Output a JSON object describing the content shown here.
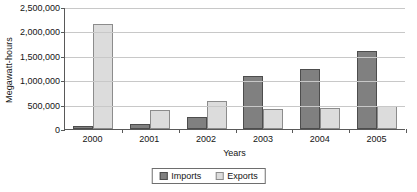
{
  "chart_data": {
    "type": "bar",
    "title": "",
    "xlabel": "Years",
    "ylabel": "Megawatt-hours",
    "categories": [
      "2000",
      "2001",
      "2002",
      "2003",
      "2004",
      "2005"
    ],
    "series": [
      {
        "name": "Imports",
        "color": "#808080",
        "values": [
          70000,
          100000,
          250000,
          1080000,
          1220000,
          1600000
        ]
      },
      {
        "name": "Exports",
        "color": "#dcdcdc",
        "values": [
          2150000,
          380000,
          580000,
          400000,
          435000,
          480000
        ]
      }
    ],
    "ylim": [
      0,
      2500000
    ],
    "ytick_values": [
      0,
      500000,
      1000000,
      1500000,
      2000000,
      2500000
    ],
    "ytick_labels": [
      "0",
      "500,000",
      "1,000,000",
      "1,500,000",
      "2,000,000",
      "2,500,000"
    ],
    "grid": true,
    "legend_position": "bottom"
  },
  "legend": {
    "items": [
      {
        "label": "Imports",
        "swatch": "imports-swatch"
      },
      {
        "label": "Exports",
        "swatch": "exports-swatch"
      }
    ]
  }
}
